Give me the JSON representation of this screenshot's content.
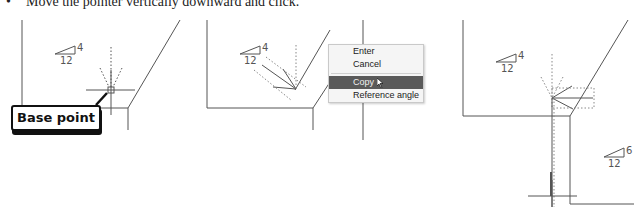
{
  "instruction": {
    "bullet": "•",
    "text": "Move the pointer vertically downward and click."
  },
  "panels": [
    {
      "slope": {
        "rise": "4",
        "run": "12"
      },
      "callout": "Base point"
    },
    {
      "slope": {
        "rise": "4",
        "run": "12"
      },
      "context_menu": {
        "items": [
          {
            "label": "Enter",
            "active": false
          },
          {
            "label": "Cancel",
            "active": false
          },
          {
            "label": "Copy",
            "active": true
          },
          {
            "label": "Reference angle",
            "active": false
          }
        ]
      }
    },
    {
      "slope_upper": {
        "rise": "4",
        "run": "12"
      },
      "slope_lower": {
        "rise": "6",
        "run": "12"
      }
    }
  ],
  "colors": {
    "line": "#555555",
    "menu_highlight": "#5a5a5a",
    "callout_border": "#111111"
  }
}
